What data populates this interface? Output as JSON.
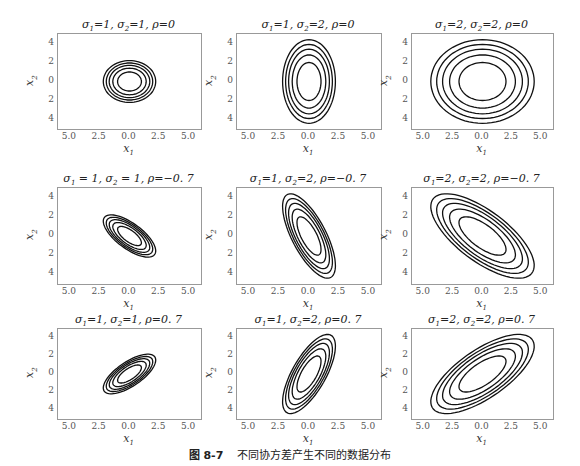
{
  "figure": {
    "caption_label": "图 8-7",
    "caption_text": "不同协方差产生不同的数据分布"
  },
  "chart_data": [
    {
      "type": "contour",
      "title": "σ1=1, σ2=1, ρ=0",
      "sigma1": 1,
      "sigma2": 1,
      "rho": 0,
      "xlabel": "x1",
      "ylabel": "x2",
      "xticks": [
        "5.0",
        "2.5",
        "0.0",
        "2.5",
        "5.0"
      ],
      "yticks": [
        "4",
        "2",
        "0",
        "2",
        "4"
      ],
      "xlim": [
        -6,
        6
      ],
      "ylim": [
        -5,
        5
      ],
      "levels": 5
    },
    {
      "type": "contour",
      "title": "σ1=1, σ2=2, ρ=0",
      "sigma1": 1,
      "sigma2": 2,
      "rho": 0,
      "xlabel": "x1",
      "ylabel": "x2",
      "xticks": [
        "5.0",
        "2.5",
        "0.0",
        "2.5",
        "5.0"
      ],
      "yticks": [
        "4",
        "2",
        "0",
        "2",
        "4"
      ],
      "xlim": [
        -6,
        6
      ],
      "ylim": [
        -5,
        5
      ],
      "levels": 5
    },
    {
      "type": "contour",
      "title": "σ1=2, σ2=2, ρ=0",
      "sigma1": 2,
      "sigma2": 2,
      "rho": 0,
      "xlabel": "x1",
      "ylabel": "x2",
      "xticks": [
        "5.0",
        "2.5",
        "0.0",
        "2.5",
        "5.0"
      ],
      "yticks": [
        "4",
        "2",
        "0",
        "2",
        "4"
      ],
      "xlim": [
        -6,
        6
      ],
      "ylim": [
        -5,
        5
      ],
      "levels": 5
    },
    {
      "type": "contour",
      "title": "σ1=1, σ2=1, ρ=-0.7",
      "sigma1": 1,
      "sigma2": 1,
      "rho": -0.7,
      "xlabel": "x1",
      "ylabel": "x2",
      "xticks": [
        "5.0",
        "2.5",
        "0.0",
        "2.5",
        "5.0"
      ],
      "yticks": [
        "4",
        "2",
        "0",
        "2",
        "4"
      ],
      "xlim": [
        -6,
        6
      ],
      "ylim": [
        -5,
        5
      ],
      "levels": 5
    },
    {
      "type": "contour",
      "title": "σ1=1, σ2=2, ρ=-0.7",
      "sigma1": 1,
      "sigma2": 2,
      "rho": -0.7,
      "xlabel": "x1",
      "ylabel": "x2",
      "xticks": [
        "5.0",
        "2.5",
        "0.0",
        "2.5",
        "5.0"
      ],
      "yticks": [
        "4",
        "2",
        "0",
        "2",
        "4"
      ],
      "xlim": [
        -6,
        6
      ],
      "ylim": [
        -5,
        5
      ],
      "levels": 5
    },
    {
      "type": "contour",
      "title": "σ1=2, σ2=2, ρ=-0.7",
      "sigma1": 2,
      "sigma2": 2,
      "rho": -0.7,
      "xlabel": "x1",
      "ylabel": "x2",
      "xticks": [
        "5.0",
        "2.5",
        "0.0",
        "2.5",
        "5.0"
      ],
      "yticks": [
        "4",
        "2",
        "0",
        "2",
        "4"
      ],
      "xlim": [
        -6,
        6
      ],
      "ylim": [
        -5,
        5
      ],
      "levels": 5
    },
    {
      "type": "contour",
      "title": "σ1=1, σ2=1, ρ=0.7",
      "sigma1": 1,
      "sigma2": 1,
      "rho": 0.7,
      "xlabel": "x1",
      "ylabel": "x2",
      "xticks": [
        "5.0",
        "2.5",
        "0.0",
        "2.5",
        "5.0"
      ],
      "yticks": [
        "4",
        "2",
        "0",
        "2",
        "4"
      ],
      "xlim": [
        -6,
        6
      ],
      "ylim": [
        -5,
        5
      ],
      "levels": 5
    },
    {
      "type": "contour",
      "title": "σ1=1, σ2=2, ρ=0.7",
      "sigma1": 1,
      "sigma2": 2,
      "rho": 0.7,
      "xlabel": "x1",
      "ylabel": "x2",
      "xticks": [
        "5.0",
        "2.5",
        "0.0",
        "2.5",
        "5.0"
      ],
      "yticks": [
        "4",
        "2",
        "0",
        "2",
        "4"
      ],
      "xlim": [
        -6,
        6
      ],
      "ylim": [
        -5,
        5
      ],
      "levels": 5
    },
    {
      "type": "contour",
      "title": "σ1=2, σ2=2, ρ=0.7",
      "sigma1": 2,
      "sigma2": 2,
      "rho": 0.7,
      "xlabel": "x1",
      "ylabel": "x2",
      "xticks": [
        "5.0",
        "2.5",
        "0.0",
        "2.5",
        "5.0"
      ],
      "yticks": [
        "4",
        "2",
        "0",
        "2",
        "4"
      ],
      "xlim": [
        -6,
        6
      ],
      "ylim": [
        -5,
        5
      ],
      "levels": 5
    }
  ],
  "panels_display": [
    {
      "t1": "σ",
      "s1": "1",
      "e1": "=1, ",
      "t2": "σ",
      "s2": "2",
      "e2": "=1, ρ=0"
    },
    {
      "t1": "σ",
      "s1": "1",
      "e1": "=1, ",
      "t2": "σ",
      "s2": "2",
      "e2": "=2, ρ=0"
    },
    {
      "t1": "σ",
      "s1": "1",
      "e1": "=2, ",
      "t2": "σ",
      "s2": "2",
      "e2": "=2, ρ=0"
    },
    {
      "t1": "σ",
      "s1": "1",
      "e1": " = 1, ",
      "t2": "σ",
      "s2": "2",
      "e2": " = 1, ρ=−0. 7"
    },
    {
      "t1": "σ",
      "s1": "1",
      "e1": "=1, ",
      "t2": "σ",
      "s2": "2",
      "e2": "=2, ρ=−0. 7"
    },
    {
      "t1": "σ",
      "s1": "1",
      "e1": "=2, ",
      "t2": "σ",
      "s2": "2",
      "e2": "=2, ρ=−0. 7"
    },
    {
      "t1": "σ",
      "s1": "1",
      "e1": "=1, ",
      "t2": "σ",
      "s2": "2",
      "e2": "=1, ρ=0. 7"
    },
    {
      "t1": "σ",
      "s1": "1",
      "e1": "=1, ",
      "t2": "σ",
      "s2": "2",
      "e2": "=2, ρ=0. 7"
    },
    {
      "t1": "σ",
      "s1": "1",
      "e1": "=2, ",
      "t2": "σ",
      "s2": "2",
      "e2": "=2, ρ=0. 7"
    }
  ],
  "axis": {
    "xlabel": "x",
    "xsub": "1",
    "ylabel": "x",
    "ysub": "2"
  }
}
